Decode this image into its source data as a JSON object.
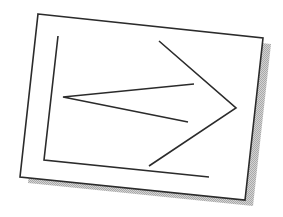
{
  "figure": {
    "colors": {
      "background": "#ffffff",
      "card_fill": "#ffffff",
      "stroke": "#2b2b2b",
      "shadow": "#bdbdbd"
    },
    "card": {
      "points": "38,14 263,38 245,200 20,177",
      "shadow_points": "46,20 271,44 253,206 28,183"
    },
    "strokes": {
      "bracket": "58,36 44,160 209,177",
      "inner_chevron": "194,84 63,97 188,122",
      "outer_chevron": "159,41 236,108 149,166"
    }
  }
}
